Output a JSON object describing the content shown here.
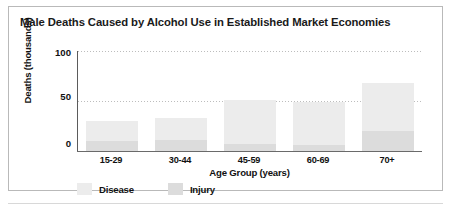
{
  "chart_data": {
    "type": "bar",
    "title": "Male Deaths Caused by Alcohol Use in Established Market Economies",
    "xlabel": "Age Group (years)",
    "ylabel": "Deaths (thousands)",
    "categories": [
      "15-29",
      "30-44",
      "45-59",
      "60-69",
      "70+"
    ],
    "series": [
      {
        "name": "Disease",
        "color": "#ececec",
        "values": [
          20,
          22,
          44,
          43,
          48
        ]
      },
      {
        "name": "Injury",
        "color": "#dcdcdc",
        "values": [
          10,
          11,
          7,
          6,
          20
        ]
      }
    ],
    "totals": [
      30,
      33,
      51,
      49,
      68
    ],
    "stacked": true,
    "ylim": [
      0,
      100
    ],
    "yticks": [
      "0",
      "50",
      "100"
    ],
    "ytick_values": [
      0,
      50,
      100
    ],
    "grid": "horizontal-dotted",
    "legend_position": "bottom-left"
  },
  "legend": {
    "items": [
      {
        "label": "Disease",
        "color": "#ececec"
      },
      {
        "label": "Injury",
        "color": "#dcdcdc"
      }
    ]
  }
}
